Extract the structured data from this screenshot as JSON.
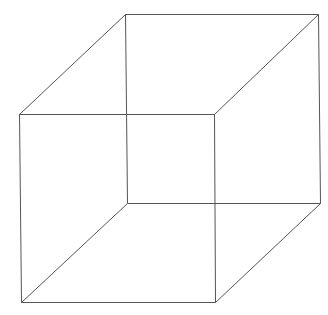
{
  "diagram": {
    "stroke_color": "#555555",
    "stroke_width": 1,
    "background": "#ffffff",
    "vertices": {
      "front_tl": [
        19,
        114
      ],
      "front_tr": [
        214,
        114
      ],
      "front_bl": [
        21,
        302
      ],
      "front_br": [
        215,
        302
      ],
      "back_tl": [
        125,
        14
      ],
      "back_tr": [
        318,
        14
      ],
      "back_bl": [
        127,
        203
      ],
      "back_br": [
        320,
        203
      ]
    },
    "edges": [
      [
        "front_tl",
        "front_tr"
      ],
      [
        "front_tr",
        "front_br"
      ],
      [
        "front_br",
        "front_bl"
      ],
      [
        "front_bl",
        "front_tl"
      ],
      [
        "back_tl",
        "back_tr"
      ],
      [
        "back_tr",
        "back_br"
      ],
      [
        "back_br",
        "back_bl"
      ],
      [
        "back_bl",
        "back_tl"
      ],
      [
        "front_tl",
        "back_tl"
      ],
      [
        "front_tr",
        "back_tr"
      ],
      [
        "front_bl",
        "back_bl"
      ],
      [
        "front_br",
        "back_br"
      ]
    ]
  }
}
